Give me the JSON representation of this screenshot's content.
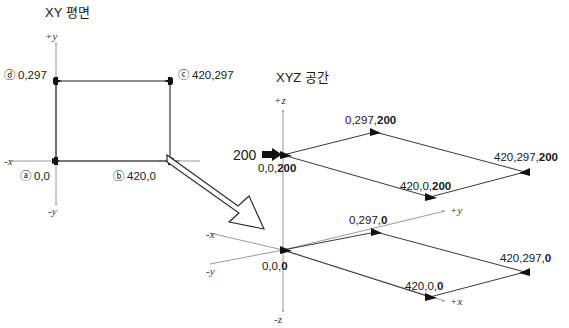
{
  "figure": {
    "xy_panel": {
      "title": "XY 평면",
      "axes": {
        "pos_y": "+y",
        "neg_y": "-y",
        "pos_x": "+x",
        "neg_x": "-x"
      },
      "points": [
        {
          "marker": "ⓐ",
          "label": "0,0"
        },
        {
          "marker": "ⓑ",
          "label": "420,0"
        },
        {
          "marker": "ⓒ",
          "label": "420,297"
        },
        {
          "marker": "ⓓ",
          "label": "0,297"
        }
      ]
    },
    "xyz_panel": {
      "title": "XYZ 공간",
      "axes": {
        "pos_z": "+z",
        "neg_z": "-z",
        "pos_y": "+y",
        "neg_y": "-y",
        "pos_x": "+x",
        "neg_x": "-x"
      },
      "height_callout": "200",
      "top_plane": {
        "origin_prefix": "0,0,",
        "origin_z": "200",
        "p_0_297_prefix": "0,297,",
        "p_0_297_z": "200",
        "p_420_0_prefix": "420,0,",
        "p_420_0_z": "200",
        "p_420_297_prefix": "420,297,",
        "p_420_297_z": "200"
      },
      "bottom_plane": {
        "origin_prefix": "0,0,",
        "origin_z": "0",
        "p_0_297_prefix": "0,297,",
        "p_0_297_z": "0",
        "p_420_0_prefix": "420,0,",
        "p_420_0_z": "0",
        "p_420_297_prefix": "420,297,",
        "p_420_297_z": "0"
      }
    },
    "colors": {
      "ink": "#1a1a1a",
      "axis": "#9a9a9a",
      "edge": "#3a3a3a",
      "background": "#ffffff"
    }
  }
}
